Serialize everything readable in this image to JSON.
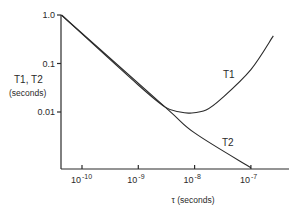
{
  "chart_data": {
    "type": "line",
    "title": "",
    "xlabel": "τ (seconds)",
    "ylabel_lines": [
      "T1, T2",
      "(seconds)"
    ],
    "x_scale": "log",
    "y_scale": "log",
    "xlim": [
      4.3e-11,
      5e-07
    ],
    "ylim": [
      0.0005,
      1.0
    ],
    "grid": false,
    "x_ticks": [
      {
        "value": 1e-10,
        "base": "10",
        "exp": "-10"
      },
      {
        "value": 1e-09,
        "base": "10",
        "exp": "-9"
      },
      {
        "value": 1e-08,
        "base": "10",
        "exp": "-8"
      },
      {
        "value": 1e-07,
        "base": "10",
        "exp": "-7"
      }
    ],
    "y_ticks": [
      {
        "value": 1.0,
        "label": "1.0"
      },
      {
        "value": 0.1,
        "label": "0.1"
      },
      {
        "value": 0.01,
        "label": "0.01"
      }
    ],
    "series": [
      {
        "name": "T2",
        "label": "T2",
        "points": [
          [
            4.3e-11,
            1.0
          ],
          [
            3e-09,
            0.0126
          ],
          [
            1e-08,
            0.0037
          ],
          [
            1e-07,
            0.00071
          ]
        ]
      },
      {
        "name": "T1",
        "label": "T1",
        "points": [
          [
            4.3e-11,
            1.0
          ],
          [
            1e-09,
            0.036
          ],
          [
            3e-09,
            0.0126
          ],
          [
            5.5e-09,
            0.01
          ],
          [
            8.3e-09,
            0.0095
          ],
          [
            1.6e-08,
            0.011
          ],
          [
            3.1e-08,
            0.0195
          ],
          [
            1e-07,
            0.075
          ],
          [
            2.5e-07,
            0.37
          ]
        ]
      }
    ]
  }
}
